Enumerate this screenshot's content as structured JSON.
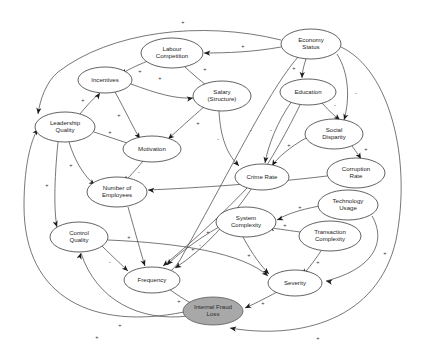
{
  "diagram": {
    "type": "causal-loop-diagram",
    "canvas": {
      "width": 422,
      "height": 348,
      "background": "#ffffff"
    },
    "style": {
      "node_fill": "#ffffff",
      "node_stroke": "#3a3a3a",
      "outcome_fill": "#a8a8a8",
      "outcome_stroke": "#5a5a5a",
      "link_stroke": "#4a4a4a",
      "arrow_fill": "#1a1a1a",
      "label_color": "#1c1c1c"
    },
    "nodes": [
      {
        "id": "labour_competition",
        "label": "Labour Competition",
        "lines": [
          "Labour",
          "Competition"
        ],
        "cx": 172,
        "cy": 53,
        "rx": 31,
        "ry": 15,
        "kind": "variable"
      },
      {
        "id": "economy_status",
        "label": "Economy Status",
        "lines": [
          "Economy",
          "Status"
        ],
        "cx": 311,
        "cy": 44,
        "rx": 30,
        "ry": 15,
        "kind": "variable"
      },
      {
        "id": "incentives",
        "label": "Incentives",
        "lines": [
          "Incentives"
        ],
        "cx": 105,
        "cy": 80,
        "rx": 27,
        "ry": 13,
        "kind": "variable"
      },
      {
        "id": "salary_structure",
        "label": "Salary (Structure)",
        "lines": [
          "Salary",
          "(Structure)"
        ],
        "cx": 222,
        "cy": 96,
        "rx": 29,
        "ry": 15,
        "kind": "variable"
      },
      {
        "id": "education",
        "label": "Education",
        "lines": [
          "Education"
        ],
        "cx": 308,
        "cy": 92,
        "rx": 28,
        "ry": 13,
        "kind": "variable"
      },
      {
        "id": "leadership_quality",
        "label": "Leadership Quality",
        "lines": [
          "Leadership",
          "Quality"
        ],
        "cx": 65,
        "cy": 127,
        "rx": 30,
        "ry": 15,
        "kind": "variable"
      },
      {
        "id": "motivation",
        "label": "Motivation",
        "lines": [
          "Motivation"
        ],
        "cx": 152,
        "cy": 149,
        "rx": 29,
        "ry": 13,
        "kind": "variable"
      },
      {
        "id": "social_disparity",
        "label": "Social Disparity",
        "lines": [
          "Social",
          "Disparity"
        ],
        "cx": 334,
        "cy": 134,
        "rx": 29,
        "ry": 15,
        "kind": "variable"
      },
      {
        "id": "corruption_rate",
        "label": "Corruption Rate",
        "lines": [
          "Corruption",
          "Rate"
        ],
        "cx": 356,
        "cy": 173,
        "rx": 29,
        "ry": 15,
        "kind": "variable"
      },
      {
        "id": "crime_rate",
        "label": "Crime Rate",
        "lines": [
          "Crime Rate"
        ],
        "cx": 262,
        "cy": 177,
        "rx": 27,
        "ry": 13,
        "kind": "variable"
      },
      {
        "id": "number_of_employees",
        "label": "Number of Employees",
        "lines": [
          "Number of",
          "Employees"
        ],
        "cx": 117,
        "cy": 192,
        "rx": 30,
        "ry": 15,
        "kind": "variable"
      },
      {
        "id": "technology_usage",
        "label": "Technology Usage",
        "lines": [
          "Technology",
          "Usage"
        ],
        "cx": 348,
        "cy": 205,
        "rx": 30,
        "ry": 15,
        "kind": "variable"
      },
      {
        "id": "system_complexity",
        "label": "System Complexity",
        "lines": [
          "System",
          "Complexity"
        ],
        "cx": 246,
        "cy": 222,
        "rx": 30,
        "ry": 15,
        "kind": "variable"
      },
      {
        "id": "transaction_complexity",
        "label": "Transaction Complexity",
        "lines": [
          "Transaction",
          "Complexity"
        ],
        "cx": 330,
        "cy": 236,
        "rx": 31,
        "ry": 15,
        "kind": "variable"
      },
      {
        "id": "control_quality",
        "label": "Control Quality",
        "lines": [
          "Control",
          "Quality"
        ],
        "cx": 79,
        "cy": 237,
        "rx": 29,
        "ry": 15,
        "kind": "variable"
      },
      {
        "id": "frequency",
        "label": "Frequency",
        "lines": [
          "Frequency"
        ],
        "cx": 152,
        "cy": 280,
        "rx": 28,
        "ry": 13,
        "kind": "variable"
      },
      {
        "id": "severity",
        "label": "Severity",
        "lines": [
          "Severity"
        ],
        "cx": 295,
        "cy": 283,
        "rx": 27,
        "ry": 13,
        "kind": "variable"
      },
      {
        "id": "internal_fraud_loss",
        "label": "Internal Fraud Loss",
        "lines": [
          "Internal Fraud",
          "Loss"
        ],
        "cx": 213,
        "cy": 311,
        "rx": 30,
        "ry": 14,
        "kind": "outcome"
      }
    ],
    "links": [
      {
        "from": "incentives",
        "to": "salary_structure",
        "polarity": "+",
        "path": "M131,84 C158,94 176,99 193,98",
        "px": 160,
        "py": 79,
        "ax": 193,
        "ay": 98,
        "adeg": 350
      },
      {
        "from": "labour_competition",
        "to": "salary_structure",
        "polarity": "+",
        "path": "M185,67 C198,79 207,86 213,90",
        "px": 205,
        "py": 70,
        "ax": 213,
        "ay": 90,
        "adeg": 35
      },
      {
        "from": "economy_status",
        "to": "labour_competition",
        "polarity": "+",
        "path": "M281,47 C253,52 228,53 204,53",
        "px": 243,
        "py": 47,
        "ax": 204,
        "ay": 53,
        "adeg": 182
      },
      {
        "from": "economy_status",
        "to": "education",
        "polarity": "+",
        "path": "M306,59 C303,68 302,74 302,78",
        "px": 294,
        "py": 69,
        "ax": 302,
        "ay": 78,
        "adeg": 92
      },
      {
        "from": "economy_status",
        "to": "social_disparity",
        "polarity": "-",
        "path": "M337,54 C349,73 350,99 344,120",
        "px": 356,
        "py": 94,
        "ax": 344,
        "ay": 120,
        "adeg": 108
      },
      {
        "from": "education",
        "to": "social_disparity",
        "polarity": "-",
        "path": "M322,103 C330,112 336,117 340,120",
        "px": 335,
        "py": 106,
        "ax": 340,
        "ay": 120,
        "adeg": 40
      },
      {
        "from": "education",
        "to": "crime_rate",
        "polarity": "-",
        "path": "M292,101 C277,122 268,146 265,163",
        "px": 271,
        "py": 131,
        "ax": 265,
        "ay": 163,
        "adeg": 100
      },
      {
        "from": "social_disparity",
        "to": "corruption_rate",
        "polarity": "+",
        "path": "M352,146 C357,153 360,157 361,159",
        "px": 366,
        "py": 150,
        "ax": 361,
        "ay": 159,
        "adeg": 60
      },
      {
        "from": "social_disparity",
        "to": "crime_rate",
        "polarity": "+",
        "path": "M306,138 C290,147 277,158 272,166",
        "px": 289,
        "py": 146,
        "ax": 272,
        "ay": 166,
        "adeg": 122
      },
      {
        "from": "salary_structure",
        "to": "crime_rate",
        "polarity": "-",
        "path": "M219,111 C220,130 224,152 239,166",
        "px": 218,
        "py": 140,
        "ax": 239,
        "ay": 166,
        "adeg": 48
      },
      {
        "from": "leadership_quality",
        "to": "incentives",
        "polarity": "+",
        "path": "M80,114 C88,104 95,97 100,93",
        "px": 83,
        "py": 101,
        "ax": 100,
        "ay": 93,
        "adeg": 305
      },
      {
        "from": "leadership_quality",
        "to": "motivation",
        "polarity": "+",
        "path": "M94,132 C112,138 127,143 136,146",
        "px": 110,
        "py": 133,
        "ax": 136,
        "ay": 146,
        "adeg": 20
      },
      {
        "from": "incentives",
        "to": "motivation",
        "polarity": "+",
        "path": "M115,92 C126,112 134,129 140,139",
        "px": 119,
        "py": 116,
        "ax": 140,
        "ay": 139,
        "adeg": 58
      },
      {
        "from": "salary_structure",
        "to": "motivation",
        "polarity": "+",
        "path": "M205,106 C190,119 177,131 168,139",
        "px": 198,
        "py": 124,
        "ax": 168,
        "ay": 139,
        "adeg": 140
      },
      {
        "from": "motivation",
        "to": "number_of_employees",
        "polarity": "-",
        "path": "M143,161 C135,171 128,178 124,182",
        "px": 139,
        "py": 173,
        "ax": 124,
        "ay": 182,
        "adeg": 130
      },
      {
        "from": "leadership_quality",
        "to": "number_of_employees",
        "polarity": "+",
        "path": "M69,142 C75,162 85,177 95,185",
        "px": 71,
        "py": 166,
        "ax": 95,
        "ay": 185,
        "adeg": 38
      },
      {
        "from": "leadership_quality",
        "to": "control_quality",
        "polarity": "+",
        "path": "M58,142 C54,182 54,212 57,227",
        "px": 47,
        "py": 186,
        "ax": 57,
        "ay": 227,
        "adeg": 72
      },
      {
        "from": "number_of_employees",
        "to": "frequency",
        "polarity": "+",
        "path": "M128,207 C136,235 142,257 145,266",
        "px": 129,
        "py": 238,
        "ax": 145,
        "ay": 266,
        "adeg": 70
      },
      {
        "from": "control_quality",
        "to": "frequency",
        "polarity": "-",
        "path": "M102,246 C114,258 123,266 128,271",
        "px": 110,
        "py": 263,
        "ax": 128,
        "ay": 271,
        "adeg": 42
      },
      {
        "from": "crime_rate",
        "to": "frequency",
        "polarity": "+",
        "path": "M247,188 C215,222 180,252 163,266",
        "px": 208,
        "py": 233,
        "ax": 163,
        "ay": 266,
        "adeg": 140
      },
      {
        "from": "system_complexity",
        "to": "frequency",
        "polarity": "+",
        "path": "M219,227 C196,240 176,256 167,265",
        "px": 193,
        "py": 250,
        "ax": 167,
        "ay": 265,
        "adeg": 132
      },
      {
        "from": "technology_usage",
        "to": "system_complexity",
        "polarity": "+",
        "path": "M320,206 C297,210 283,216 277,220",
        "px": 300,
        "py": 208,
        "ax": 277,
        "ay": 220,
        "adeg": 160
      },
      {
        "from": "transaction_complexity",
        "to": "system_complexity",
        "polarity": "+",
        "path": "M300,232 C285,230 274,228 268,228",
        "px": 285,
        "py": 226,
        "ax": 268,
        "ay": 228,
        "adeg": 186
      },
      {
        "from": "system_complexity",
        "to": "severity",
        "polarity": "+",
        "path": "M243,237 C252,254 262,267 269,274",
        "px": 249,
        "py": 256,
        "ax": 269,
        "ay": 274,
        "adeg": 44
      },
      {
        "from": "transaction_complexity",
        "to": "severity",
        "polarity": "+",
        "path": "M321,251 C313,263 306,271 303,275",
        "px": 318,
        "py": 263,
        "ax": 303,
        "ay": 275,
        "adeg": 122
      },
      {
        "from": "technology_usage",
        "to": "severity",
        "polarity": "+",
        "path": "M372,216 C386,240 376,268 326,281",
        "px": 385,
        "py": 254,
        "ax": 326,
        "ay": 281,
        "adeg": 190
      },
      {
        "from": "frequency",
        "to": "internal_fraud_loss",
        "polarity": "+",
        "path": "M169,289 C180,297 190,303 197,306",
        "px": 179,
        "py": 302,
        "ax": 197,
        "ay": 306,
        "adeg": 28
      },
      {
        "from": "severity",
        "to": "internal_fraud_loss",
        "polarity": "+",
        "path": "M277,292 C264,299 252,305 245,308",
        "px": 263,
        "py": 304,
        "ax": 245,
        "ay": 308,
        "adeg": 156
      },
      {
        "from": "internal_fraud_loss",
        "to": "control_quality",
        "polarity": "+",
        "path": "M188,316 C140,322 96,300 81,253",
        "px": 120,
        "py": 326,
        "ax": 81,
        "ay": 253,
        "adeg": 288
      },
      {
        "from": "internal_fraud_loss",
        "to": "leadership_quality",
        "polarity": "+",
        "path": "M184,312 C96,330 24,300 24,206 C24,160 33,136 38,129",
        "px": 97,
        "py": 338,
        "ax": 38,
        "ay": 129,
        "adeg": 304
      },
      {
        "from": "corruption_rate",
        "to": "number_of_employees",
        "polarity": "-",
        "path": "M327,176 C270,183 196,188 148,190",
        "px": 240,
        "py": 180,
        "ax": 148,
        "ay": 190,
        "adeg": 183
      },
      {
        "from": "control_quality",
        "to": "severity",
        "polarity": "-",
        "path": "M108,240 C180,243 243,253 268,276",
        "px": 200,
        "py": 246,
        "ax": 268,
        "ay": 276,
        "adeg": 42
      },
      {
        "from": "economy_status",
        "to": "leadership_quality",
        "polarity": "+",
        "path": "M281,40 C200,20 110,32 58,72 C46,82 40,100 38,114",
        "px": 183,
        "py": 23,
        "ax": 38,
        "ay": 114,
        "adeg": 98
      },
      {
        "from": "economy_status",
        "to": "frequency",
        "polarity": "-",
        "path": "M298,57 C268,92 236,160 180,260 C172,272 166,276 160,271",
        "px": 251,
        "py": 131,
        "ax": 160,
        "ay": 271,
        "adeg": 220
      },
      {
        "from": "education",
        "to": "frequency",
        "polarity": "-",
        "path": "M300,105 C278,150 233,231 175,268",
        "px": 249,
        "py": 170,
        "ax": 175,
        "ay": 268,
        "adeg": 148
      },
      {
        "from": "economy_status",
        "to": "internal_fraud_loss",
        "polarity": "+",
        "path": "M341,47 C390,70 412,160 396,240 C378,320 300,340 230,328",
        "px": 318,
        "py": 339,
        "ax": 230,
        "ay": 328,
        "adeg": 190
      },
      {
        "from": "labour_competition",
        "to": "incentives",
        "polarity": "+",
        "path": "M148,61 C135,66 126,71 121,74",
        "px": 140,
        "py": 72,
        "ax": 121,
        "ay": 74,
        "adeg": 150
      }
    ]
  }
}
